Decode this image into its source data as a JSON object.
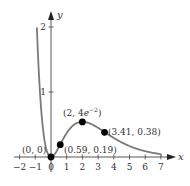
{
  "chart_data": {
    "type": "line",
    "title": "",
    "function": "y = x^2 e^{-x}",
    "xlabel": "x",
    "ylabel": "y",
    "xlim": [
      -2,
      7
    ],
    "ylim": [
      0,
      2
    ],
    "grid": false,
    "legend": null,
    "x_ticks": [
      "−2",
      "−1",
      "0",
      "1",
      "2",
      "3",
      "4",
      "5",
      "6",
      "7"
    ],
    "x_tick_values": [
      -2,
      -1,
      0,
      1,
      2,
      3,
      4,
      5,
      6,
      7
    ],
    "y_ticks": [
      "1",
      "2"
    ],
    "y_tick_values": [
      1,
      2
    ],
    "curve_domain": [
      -0.9,
      7
    ],
    "series": [
      {
        "name": "x^2 e^{-x}",
        "color": "#777777",
        "x": [
          -0.9,
          -0.8,
          -0.6,
          -0.4,
          -0.2,
          0,
          0.2,
          0.4,
          0.59,
          0.8,
          1,
          1.5,
          2,
          2.5,
          3,
          3.41,
          4,
          4.5,
          5,
          5.5,
          6,
          6.5,
          7
        ],
        "y": [
          1.99,
          1.42,
          0.66,
          0.24,
          0.05,
          0,
          0.03,
          0.11,
          0.19,
          0.29,
          0.37,
          0.5,
          0.54,
          0.51,
          0.45,
          0.38,
          0.29,
          0.22,
          0.17,
          0.12,
          0.09,
          0.06,
          0.045
        ]
      }
    ],
    "points": [
      {
        "x": 0,
        "y": 0,
        "label": "(0, 0)"
      },
      {
        "x": 0.59,
        "y": 0.19,
        "label": "(0.59, 0.19)"
      },
      {
        "x": 2,
        "y": 0.54,
        "label": "(2, 4e⁻²)"
      },
      {
        "x": 3.41,
        "y": 0.38,
        "label": "(3.41, 0.38)"
      }
    ]
  },
  "labels": {
    "x_axis": "x",
    "y_axis": "y",
    "p0": "(0, 0)",
    "p1": "(0.59, 0.19)",
    "p2_main": "(2, 4",
    "p2_e": "e",
    "p2_exp": "−2",
    "p2_close": ")",
    "p3": "(3.41, 0.38)",
    "tick_x": [
      "−2",
      "−1",
      "0",
      "1",
      "2",
      "3",
      "4",
      "5",
      "6",
      "7"
    ],
    "tick_y": [
      "1",
      "2"
    ]
  }
}
